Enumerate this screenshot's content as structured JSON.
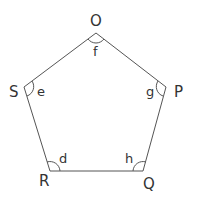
{
  "diagram": {
    "type": "pentagon",
    "stroke_color": "#555555",
    "vertices": [
      {
        "name": "O",
        "x": 96,
        "y": 33,
        "angle_label": "f"
      },
      {
        "name": "P",
        "x": 166,
        "y": 87,
        "angle_label": "g"
      },
      {
        "name": "Q",
        "x": 143,
        "y": 171,
        "angle_label": "h"
      },
      {
        "name": "R",
        "x": 50,
        "y": 171,
        "angle_label": "d"
      },
      {
        "name": "S",
        "x": 24,
        "y": 87,
        "angle_label": "e"
      }
    ],
    "labels": {
      "O": "O",
      "P": "P",
      "Q": "Q",
      "R": "R",
      "S": "S",
      "d": "d",
      "e": "e",
      "f": "f",
      "g": "g",
      "h": "h"
    }
  }
}
